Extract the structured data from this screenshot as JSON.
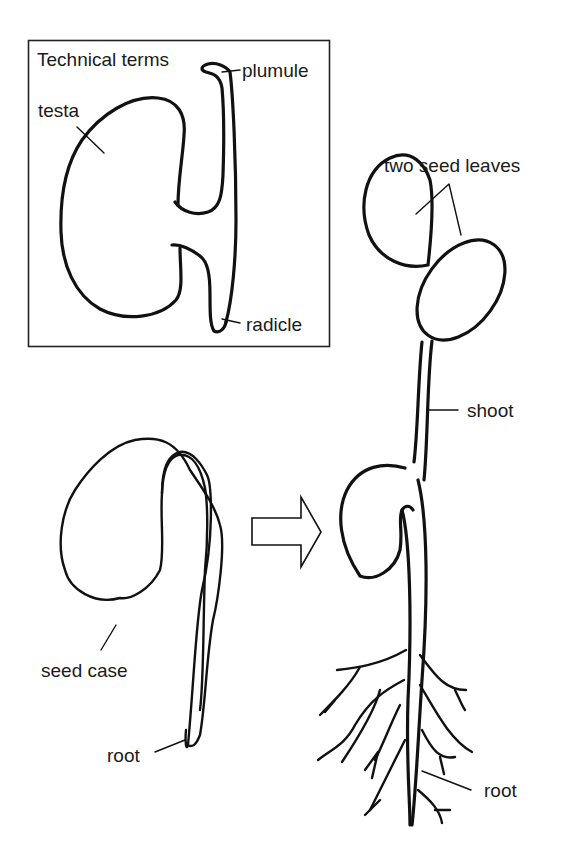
{
  "diagram": {
    "type": "biology-illustration",
    "inset": {
      "title": "Technical terms",
      "labels": {
        "testa": "testa",
        "plumule": "plumule",
        "radicle": "radicle"
      }
    },
    "germinating_seed": {
      "labels": {
        "seed_case": "seed case",
        "root": "root"
      }
    },
    "seedling": {
      "labels": {
        "seed_leaves": "two seed leaves",
        "shoot": "shoot",
        "root": "root"
      }
    },
    "arrow": {
      "meaning": "develops into",
      "direction": "right"
    },
    "colors": {
      "ink": "#111111",
      "background": "#ffffff"
    }
  }
}
